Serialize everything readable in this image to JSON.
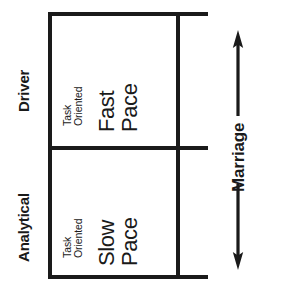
{
  "diagram": {
    "ink_color": "#1a1a1a",
    "background_color": "#ffffff",
    "row_labels": [
      {
        "name": "driver",
        "text": "Driver"
      },
      {
        "name": "analytical",
        "text": "Analytical"
      }
    ],
    "cells": [
      {
        "name": "driver-cell",
        "row": "Driver",
        "sub_line_1": "Task",
        "sub_line_2": "Oriented",
        "main_line_1": "Fast",
        "main_line_2": "Pace"
      },
      {
        "name": "analytical-cell",
        "row": "Analytical",
        "sub_line_1": "Task",
        "sub_line_2": "Oriented",
        "main_line_1": "Slow",
        "main_line_2": "Pace"
      }
    ],
    "axis": {
      "name": "marriage-axis",
      "label": "Marriage",
      "arrow_style": "double-headed",
      "orientation": "vertical"
    }
  }
}
